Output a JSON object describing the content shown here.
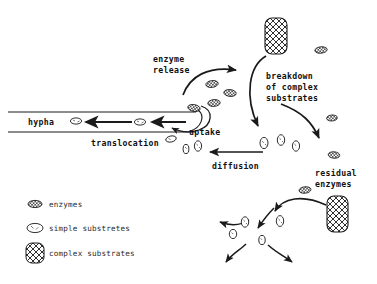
{
  "diagram": {
    "background_color": "#ffffff",
    "ink_color": "#1a1a1a",
    "labels": {
      "enzyme_release_line1": "enzyme",
      "enzyme_release_line2": "release",
      "breakdown_line1": "breakdown",
      "breakdown_line2": "of complex",
      "breakdown_line3": "substrates",
      "hypha": "hypha",
      "uptake": "uptake",
      "translocation": "translocation",
      "diffusion": "diffusion",
      "residual_line1": "residual",
      "residual_line2": "enzymes"
    },
    "legend": {
      "items": [
        {
          "symbol": "enzyme-ellipse-icon",
          "label": "enzymes"
        },
        {
          "symbol": "simple-substrate-ellipse-icon",
          "label": "simple substretes"
        },
        {
          "symbol": "complex-substrate-block-icon",
          "label": "complex substrates"
        }
      ]
    },
    "shapes": {
      "complex_substrate_blocks": [
        {
          "x": 265,
          "y": 18,
          "w": 22,
          "h": 36
        },
        {
          "x": 327,
          "y": 196,
          "w": 21,
          "h": 36
        }
      ],
      "enzymes": [
        {
          "x": 212,
          "y": 84
        },
        {
          "x": 230,
          "y": 93
        },
        {
          "x": 214,
          "y": 103
        },
        {
          "x": 194,
          "y": 108
        },
        {
          "x": 321,
          "y": 50
        },
        {
          "x": 332,
          "y": 118
        },
        {
          "x": 334,
          "y": 155
        },
        {
          "x": 305,
          "y": 190
        }
      ],
      "simple_substrates": [
        {
          "x": 76,
          "y": 121
        },
        {
          "x": 140,
          "y": 122
        },
        {
          "x": 171,
          "y": 139
        },
        {
          "x": 186,
          "y": 147
        },
        {
          "x": 198,
          "y": 145
        },
        {
          "x": 264,
          "y": 143
        },
        {
          "x": 281,
          "y": 140
        },
        {
          "x": 296,
          "y": 145
        },
        {
          "x": 245,
          "y": 222
        },
        {
          "x": 280,
          "y": 221
        },
        {
          "x": 233,
          "y": 235
        },
        {
          "x": 262,
          "y": 240
        }
      ]
    }
  }
}
